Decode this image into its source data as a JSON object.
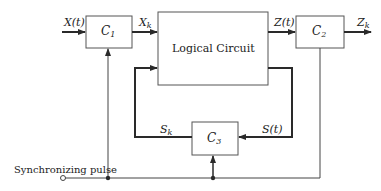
{
  "diagram": {
    "blocks": {
      "c1": {
        "label": "C",
        "sub": "1"
      },
      "logic": {
        "label": "Logical Circuit"
      },
      "c2": {
        "label": "C",
        "sub": "2"
      },
      "c3": {
        "label": "C",
        "sub": "3"
      }
    },
    "signals": {
      "input": {
        "label": "X(t)"
      },
      "xk": {
        "label": "X",
        "sub": "k"
      },
      "zt": {
        "label": "Z(t)"
      },
      "zk": {
        "label": "Z",
        "sub": "k"
      },
      "sk": {
        "label": "S",
        "sub": "k"
      },
      "st": {
        "label": "S(t)"
      }
    },
    "sync": {
      "label": "Synchronizing pulse"
    },
    "colors": {
      "line": "#2a2a2a",
      "box_border": "#555555",
      "background": "#ffffff"
    }
  }
}
